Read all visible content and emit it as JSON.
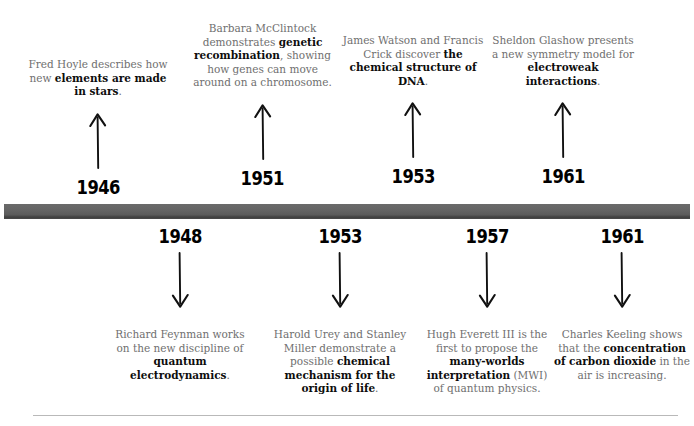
{
  "meta": {
    "bar_color": "#5b5b5b",
    "rule_color": "#b9b9b9",
    "body_text_color": "#6f6f6f",
    "emphasis_text_color": "#0d0d0d"
  },
  "timeline": {
    "above": [
      {
        "year": "1946",
        "arrow": "arrow-up-icon",
        "segments": [
          {
            "text": "Fred Hoyle describes how new ",
            "bold": false
          },
          {
            "text": "elements are made in stars",
            "bold": true
          },
          {
            "text": ".",
            "bold": false
          }
        ],
        "plain_text": "Fred Hoyle describes how new elements are made in stars."
      },
      {
        "year": "1951",
        "arrow": "arrow-up-icon",
        "segments": [
          {
            "text": "Barbara McClintock demonstrates ",
            "bold": false
          },
          {
            "text": "genetic recombination",
            "bold": true
          },
          {
            "text": ", showing how genes can move around on a chromosome.",
            "bold": false
          }
        ],
        "plain_text": "Barbara McClintock demonstrates genetic recombination, showing how genes can move around on a chromosome."
      },
      {
        "year": "1953",
        "arrow": "arrow-up-icon",
        "segments": [
          {
            "text": "James Watson and Francis Crick discover ",
            "bold": false
          },
          {
            "text": "the chemical structure of DNA",
            "bold": true
          },
          {
            "text": ".",
            "bold": false
          }
        ],
        "plain_text": "James Watson and Francis Crick discover the chemical structure of DNA."
      },
      {
        "year": "1961",
        "arrow": "arrow-up-icon",
        "segments": [
          {
            "text": "Sheldon Glashow presents a new symmetry model for ",
            "bold": false
          },
          {
            "text": "electroweak interactions",
            "bold": true
          },
          {
            "text": ".",
            "bold": false
          }
        ],
        "plain_text": "Sheldon Glashow presents a new symmetry model for electroweak interactions."
      }
    ],
    "below": [
      {
        "year": "1948",
        "arrow": "arrow-down-icon",
        "segments": [
          {
            "text": "Richard Feynman works on the new discipline of ",
            "bold": false
          },
          {
            "text": "quantum electrodynamics",
            "bold": true
          },
          {
            "text": ".",
            "bold": false
          }
        ],
        "plain_text": "Richard Feynman works on the new discipline of quantum electrodynamics."
      },
      {
        "year": "1953",
        "arrow": "arrow-down-icon",
        "segments": [
          {
            "text": "Harold Urey and Stanley Miller demonstrate a possible ",
            "bold": false
          },
          {
            "text": "chemical mechanism for the origin of life",
            "bold": true
          },
          {
            "text": ".",
            "bold": false
          }
        ],
        "plain_text": "Harold Urey and Stanley Miller demonstrate a possible chemical mechanism for the origin of life."
      },
      {
        "year": "1957",
        "arrow": "arrow-down-icon",
        "segments": [
          {
            "text": "Hugh Everett III is the first to propose the ",
            "bold": false
          },
          {
            "text": "many-worlds interpretation",
            "bold": true
          },
          {
            "text": " (MWI) of quantum physics.",
            "bold": false
          }
        ],
        "plain_text": "Hugh Everett III is the first to propose the many-worlds interpretation (MWI) of quantum physics."
      },
      {
        "year": "1961",
        "arrow": "arrow-down-icon",
        "segments": [
          {
            "text": "Charles Keeling shows that the ",
            "bold": false
          },
          {
            "text": "concentration of carbon dioxide",
            "bold": true
          },
          {
            "text": " in the air is increasing.",
            "bold": false
          }
        ],
        "plain_text": "Charles Keeling shows that the concentration of carbon dioxide in the air is increasing."
      }
    ]
  }
}
